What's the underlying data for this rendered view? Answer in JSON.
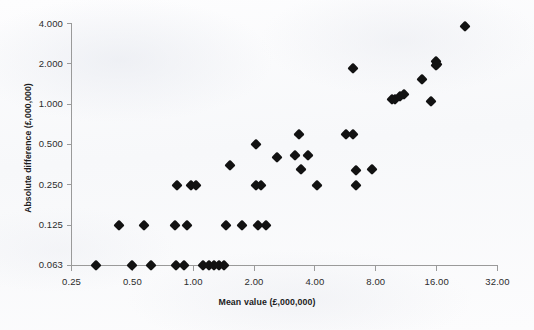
{
  "figure": {
    "background_color": "#fbfbfc",
    "marker_color": "#121212",
    "axis_color": "#9a9a9a"
  },
  "axes": {
    "y_title": "Absolute difference (£,000,000)",
    "x_title": "Mean value (£,000,000)",
    "y_ticks": [
      "0.063",
      "0.125",
      "0.250",
      "0.500",
      "1.000",
      "2.000",
      "4.000"
    ],
    "x_ticks": [
      "0.25",
      "0.50",
      "1.00",
      "2.00",
      "4.00",
      "8.00",
      "16.00",
      "32.00"
    ]
  },
  "chart_data": {
    "type": "scatter",
    "title": "",
    "subtitle": "",
    "xlabel": "Mean value (£,000,000)",
    "ylabel": "Absolute difference (£,000,000)",
    "xscale": "log2",
    "yscale": "log2",
    "xlim": [
      0.25,
      32.0
    ],
    "ylim": [
      0.063,
      4.0
    ],
    "xticks": [
      0.25,
      0.5,
      1.0,
      2.0,
      4.0,
      8.0,
      16.0,
      32.0
    ],
    "yticks": [
      0.063,
      0.125,
      0.25,
      0.5,
      1.0,
      2.0,
      4.0
    ],
    "grid": false,
    "legend": null,
    "marker": "diamond",
    "series": [
      {
        "name": "Mean value vs absolute difference",
        "points": [
          [
            0.33,
            0.063
          ],
          [
            0.43,
            0.125
          ],
          [
            0.5,
            0.063
          ],
          [
            0.57,
            0.125
          ],
          [
            0.62,
            0.063
          ],
          [
            0.81,
            0.125
          ],
          [
            0.82,
            0.063
          ],
          [
            0.83,
            0.25
          ],
          [
            0.9,
            0.063
          ],
          [
            0.93,
            0.125
          ],
          [
            0.97,
            0.25
          ],
          [
            1.03,
            0.25
          ],
          [
            1.12,
            0.063
          ],
          [
            1.2,
            0.063
          ],
          [
            1.27,
            0.063
          ],
          [
            1.34,
            0.063
          ],
          [
            1.42,
            0.063
          ],
          [
            1.45,
            0.125
          ],
          [
            1.52,
            0.35
          ],
          [
            1.75,
            0.125
          ],
          [
            2.05,
            0.5
          ],
          [
            2.05,
            0.25
          ],
          [
            2.1,
            0.125
          ],
          [
            2.17,
            0.25
          ],
          [
            2.28,
            0.125
          ],
          [
            2.6,
            0.4
          ],
          [
            3.2,
            0.42
          ],
          [
            3.35,
            0.6
          ],
          [
            3.4,
            0.33
          ],
          [
            3.7,
            0.42
          ],
          [
            4.1,
            0.25
          ],
          [
            5.7,
            0.6
          ],
          [
            6.2,
            0.6
          ],
          [
            6.2,
            1.85
          ],
          [
            6.4,
            0.25
          ],
          [
            6.4,
            0.32
          ],
          [
            7.7,
            0.33
          ],
          [
            9.6,
            1.1
          ],
          [
            10.0,
            1.1
          ],
          [
            10.6,
            1.15
          ],
          [
            11.0,
            1.2
          ],
          [
            13.5,
            1.55
          ],
          [
            15.0,
            1.05
          ],
          [
            15.8,
            1.95
          ],
          [
            15.9,
            2.1
          ],
          [
            16.1,
            2.0
          ],
          [
            22.0,
            3.8
          ]
        ]
      }
    ]
  }
}
